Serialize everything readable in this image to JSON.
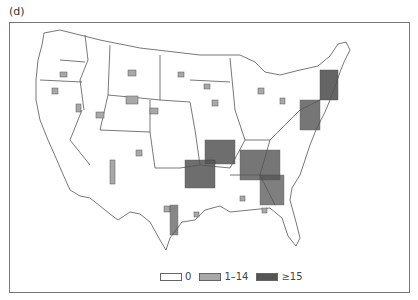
{
  "panel_label": "(d)",
  "legend": {
    "items": [
      {
        "label": "0",
        "color": "#ffffff"
      },
      {
        "label": "1–14",
        "color": "#a8a8a8"
      },
      {
        "label": "≥15",
        "color": "#555555"
      }
    ]
  },
  "colors": {
    "outline": "#555555",
    "zero": "#ffffff",
    "low": "#a8a8a8",
    "high": "#555555"
  }
}
